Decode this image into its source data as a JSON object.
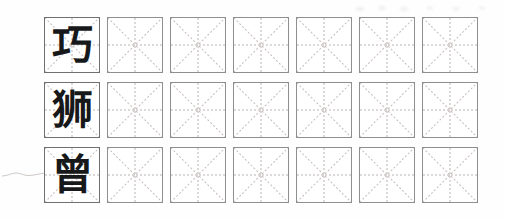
{
  "worksheet": {
    "type": "chinese-character-tracing-worksheet",
    "description": "Chinese character handwriting practice sheet: each row begins with a printed model character followed by empty practice squares.",
    "background_color": "#fefefe",
    "grid": {
      "rows": 3,
      "columns_per_row": 7,
      "cell_size_px": 54,
      "cell_gap_px": 7,
      "row_gap_px": 9,
      "cell_border_color": "#8d8f91",
      "model_cell_border_color": "#6e7072",
      "guide_line_color": "#bdb4b4",
      "diagonal_guide_color": "#c6bcbc",
      "guide_style": "dashed",
      "guides_per_cell": [
        "horizontal-center",
        "vertical-center",
        "diagonal-top-left-to-bottom-right",
        "diagonal-top-right-to-bottom-left"
      ]
    },
    "rows": [
      {
        "row_index": 1,
        "model_character": "巧",
        "character_color": "#17181a",
        "practice_cells": 6
      },
      {
        "row_index": 2,
        "model_character": "狮",
        "character_color": "#17181a",
        "practice_cells": 6
      },
      {
        "row_index": 3,
        "model_character": "曾",
        "character_color": "#17181a",
        "practice_cells": 6
      }
    ],
    "artifacts": {
      "ghost_text_top_right": "faint bleed-through of characters from reverse side",
      "stray_mark_left_of_row_3": "faint pencil squiggle"
    }
  }
}
